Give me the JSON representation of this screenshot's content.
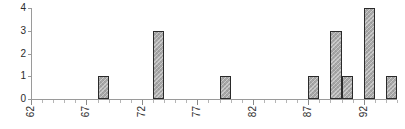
{
  "chart_data": {
    "type": "bar",
    "title": "",
    "subtitle": "",
    "xlabel": "",
    "ylabel": "",
    "xlim": [
      62,
      95
    ],
    "ylim": [
      0,
      4
    ],
    "grid": false,
    "legend": null,
    "y_ticks": [
      0,
      1,
      2,
      3,
      4
    ],
    "y_tick_labels": [
      "0",
      "1",
      "2",
      "3",
      "4"
    ],
    "x_major_ticks": [
      62,
      67,
      72,
      77,
      82,
      87,
      92
    ],
    "x_major_tick_labels": [
      "62",
      "67",
      "72",
      "77",
      "82",
      "87",
      "92"
    ],
    "x_minor_tick_step": 1,
    "x_tick_label_rotation": 90,
    "bin_width": 1,
    "bars": [
      {
        "x": 68,
        "value": 1
      },
      {
        "x": 73,
        "value": 3
      },
      {
        "x": 79,
        "value": 1
      },
      {
        "x": 87,
        "value": 1
      },
      {
        "x": 89,
        "value": 3
      },
      {
        "x": 90,
        "value": 1
      },
      {
        "x": 92,
        "value": 4
      },
      {
        "x": 94,
        "value": 1
      }
    ],
    "categories": [
      68,
      73,
      79,
      87,
      89,
      90,
      92,
      94
    ],
    "values": [
      1,
      3,
      1,
      1,
      3,
      1,
      4,
      1
    ],
    "colors": {
      "bar_fill": "#a8a8a8",
      "bar_border": "#2a2a2a",
      "axis": "#9a9a9a",
      "tick_label": "#2b2b2b",
      "background": "#ffffff"
    }
  }
}
